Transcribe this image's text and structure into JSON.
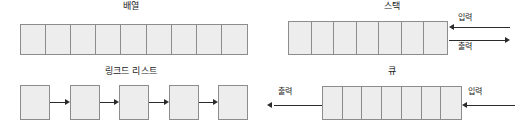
{
  "diagram": {
    "title": "",
    "background": "#ffffff",
    "cell_fill": "#ededed",
    "cell_border": "#8c8c8c",
    "arrow_color": "#2b2b2b",
    "text_color": "#1a1a1a"
  },
  "panels": {
    "array": {
      "title": "배열",
      "cell_count": 9
    },
    "stack": {
      "title": "스택",
      "cell_count": 7,
      "input_label": "입력",
      "output_label": "출력",
      "input_direction": "left",
      "output_direction": "right"
    },
    "linked_list": {
      "title": "링크드 리스트",
      "node_count": 5,
      "link_count": 4,
      "link_direction": "right"
    },
    "queue": {
      "title": "큐",
      "cell_count": 7,
      "input_label": "입력",
      "output_label": "출력",
      "input_direction": "left",
      "output_direction": "left"
    }
  }
}
